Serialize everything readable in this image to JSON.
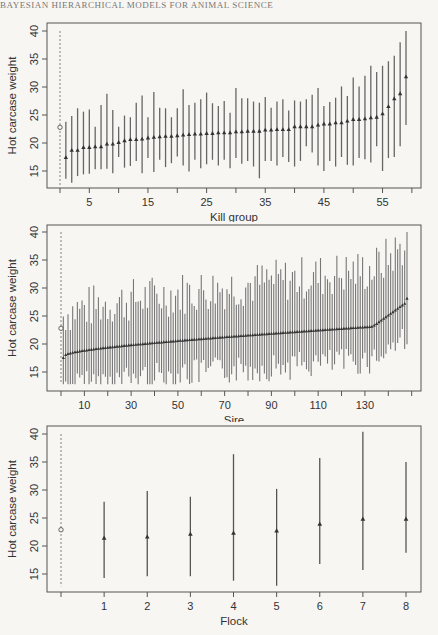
{
  "page_header": "BAYESIAN HIERARCHICAL MODELS FOR ANIMAL SCIENCE",
  "chart_data": [
    {
      "type": "errorbar",
      "panel": "kill-group",
      "xlabel": "Kill group",
      "ylabel": "Hot carcase weight",
      "ylim": [
        12,
        41
      ],
      "yticks": [
        15,
        20,
        25,
        30,
        35,
        40
      ],
      "xticks": [
        5,
        15,
        25,
        35,
        45,
        55
      ],
      "xtick_minor": [
        0,
        10,
        20,
        30,
        40,
        50,
        60
      ],
      "reference": {
        "marker": "circle",
        "value": 22.8,
        "line": "dashed",
        "range": [
          12.5,
          40
        ]
      },
      "n_groups": 59,
      "means": [
        17.4,
        18.7,
        18.7,
        19.2,
        19.2,
        19.3,
        19.3,
        19.8,
        19.8,
        20.1,
        20.4,
        20.6,
        20.6,
        20.7,
        20.9,
        21.0,
        21.1,
        21.2,
        21.2,
        21.3,
        21.4,
        21.5,
        21.6,
        21.6,
        21.7,
        21.7,
        21.8,
        21.8,
        21.8,
        22.0,
        22.0,
        22.1,
        22.1,
        22.1,
        22.3,
        22.3,
        22.4,
        22.4,
        22.4,
        22.9,
        22.9,
        22.9,
        22.9,
        23.2,
        23.4,
        23.4,
        23.6,
        23.6,
        23.9,
        24.2,
        24.2,
        24.3,
        24.5,
        24.6,
        25.2,
        26.5,
        27.9,
        28.8,
        31.8
      ],
      "upper": [
        23.8,
        24.8,
        26.2,
        25.6,
        26.0,
        22.9,
        26.8,
        28.8,
        25.9,
        22.9,
        24.9,
        24.6,
        27.2,
        28.5,
        24.6,
        29.1,
        26.3,
        26.2,
        24.6,
        26.2,
        29.6,
        26.8,
        27.2,
        27.8,
        29.0,
        27.1,
        26.6,
        27.5,
        25.4,
        29.8,
        28.0,
        28.0,
        27.4,
        27.2,
        28.2,
        26.3,
        27.4,
        27.8,
        25.8,
        27.6,
        27.4,
        27.8,
        28.6,
        29.8,
        26.6,
        27.3,
        28.1,
        30.1,
        28.4,
        31.7,
        30.1,
        32.0,
        33.8,
        32.7,
        33.8,
        34.6,
        35.6,
        38.0,
        40.0
      ],
      "lower": [
        13.6,
        12.9,
        14.1,
        14.4,
        14.5,
        15.3,
        15.3,
        15.4,
        14.6,
        17.5,
        15.6,
        15.9,
        16.8,
        14.6,
        17.3,
        14.8,
        17.0,
        15.7,
        16.4,
        17.6,
        16.0,
        14.9,
        17.0,
        15.5,
        16.2,
        17.0,
        16.0,
        17.0,
        15.5,
        17.3,
        16.3,
        16.8,
        15.8,
        13.7,
        16.8,
        16.8,
        16.0,
        17.5,
        16.6,
        15.8,
        16.8,
        19.4,
        18.3,
        16.0,
        15.0,
        16.8,
        15.8,
        17.5,
        16.1,
        16.0,
        17.3,
        17.1,
        16.5,
        19.4,
        15.0,
        17.3,
        17.5,
        19.4,
        23.2
      ]
    },
    {
      "type": "errorbar",
      "panel": "sire",
      "xlabel": "Sire",
      "ylabel": "Hot carcase weight",
      "ylim": [
        12,
        41
      ],
      "yticks": [
        15,
        20,
        25,
        30,
        35,
        40
      ],
      "xticks": [
        10,
        30,
        50,
        70,
        90,
        110,
        130
      ],
      "xtick_minor": [
        0,
        20,
        40,
        60,
        80,
        100,
        120,
        140,
        150
      ],
      "reference": {
        "marker": "circle",
        "value": 22.8,
        "line": "dashed",
        "range": [
          13,
          40
        ]
      },
      "n_groups": 148,
      "mean_start": 17.5,
      "mean_end": 28.1,
      "note": "148 sire estimates, monotonically sorted means from ~17.5 to ~28; intervals roughly +/-5 to +/-11 units"
    },
    {
      "type": "errorbar",
      "panel": "flock",
      "xlabel": "Flock",
      "ylabel": "Hot carcase weight",
      "ylim": [
        12,
        41
      ],
      "yticks": [
        15,
        20,
        25,
        30,
        35,
        40
      ],
      "categories": [
        "1",
        "2",
        "3",
        "4",
        "5",
        "6",
        "7",
        "8"
      ],
      "reference": {
        "marker": "circle",
        "value": 22.9,
        "line": "dashed",
        "range": [
          12.8,
          40
        ]
      },
      "means": [
        21.4,
        21.6,
        22.1,
        22.3,
        22.7,
        23.9,
        24.8,
        24.8
      ],
      "upper": [
        27.9,
        29.8,
        28.8,
        36.4,
        30.2,
        35.7,
        40.4,
        35.0
      ],
      "lower": [
        14.3,
        14.6,
        14.6,
        13.8,
        12.9,
        16.8,
        15.7,
        18.8
      ]
    }
  ]
}
